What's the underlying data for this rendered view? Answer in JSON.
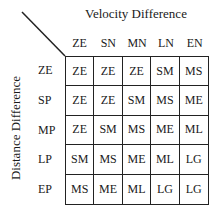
{
  "title": "Velocity Difference",
  "ylabel": "Distance Difference",
  "columns": [
    "ZE",
    "SN",
    "MN",
    "LN",
    "EN"
  ],
  "rows": [
    "ZE",
    "SP",
    "MP",
    "LP",
    "EP"
  ],
  "cells": [
    [
      "ZE",
      "ZE",
      "ZE",
      "SM",
      "MS"
    ],
    [
      "ZE",
      "ZE",
      "SM",
      "MS",
      "ME"
    ],
    [
      "ZE",
      "SM",
      "MS",
      "ME",
      "ML"
    ],
    [
      "SM",
      "MS",
      "ME",
      "ML",
      "LG"
    ],
    [
      "MS",
      "ME",
      "ML",
      "LG",
      "LG"
    ]
  ]
}
